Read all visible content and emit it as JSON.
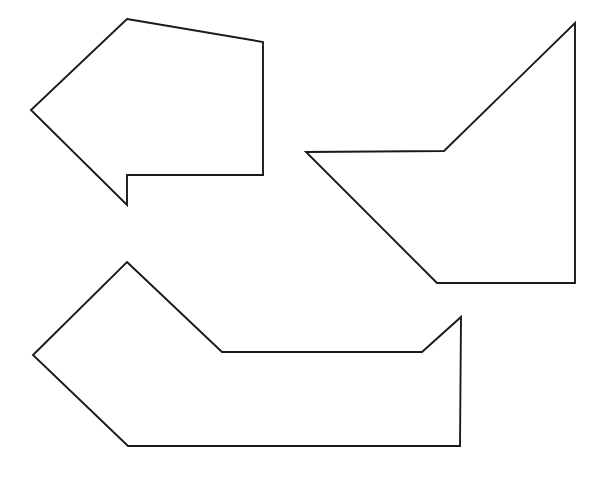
{
  "page": {
    "background_color": "#ffffff",
    "width": 603,
    "height": 477
  },
  "style": {
    "stroke_color": "#1a1a1a",
    "fill_color": "#ffffff",
    "stroke_width": 1.9
  },
  "shapes": [
    {
      "id": "left-arrow",
      "name": "left-pointing-arrow",
      "description": "Left pointing block arrow",
      "vertex_count": 6,
      "points": "127,19 263,42 263,175 127,175 127,205 31,110"
    },
    {
      "id": "right-dart",
      "name": "right-concave-polygon",
      "description": "Concave pentagon with left spike and vertical right edge",
      "vertex_count": 5,
      "points": "575,23 575,283 437,283 306,152 444,151"
    },
    {
      "id": "bottom-polygon",
      "name": "bottom-concave-polygon",
      "description": "Wide concave heptagon resembling a bent arrow / boat",
      "vertex_count": 7,
      "points": "127,262 222,352 422,352 461,317 460,446 128,446 33,355"
    }
  ]
}
